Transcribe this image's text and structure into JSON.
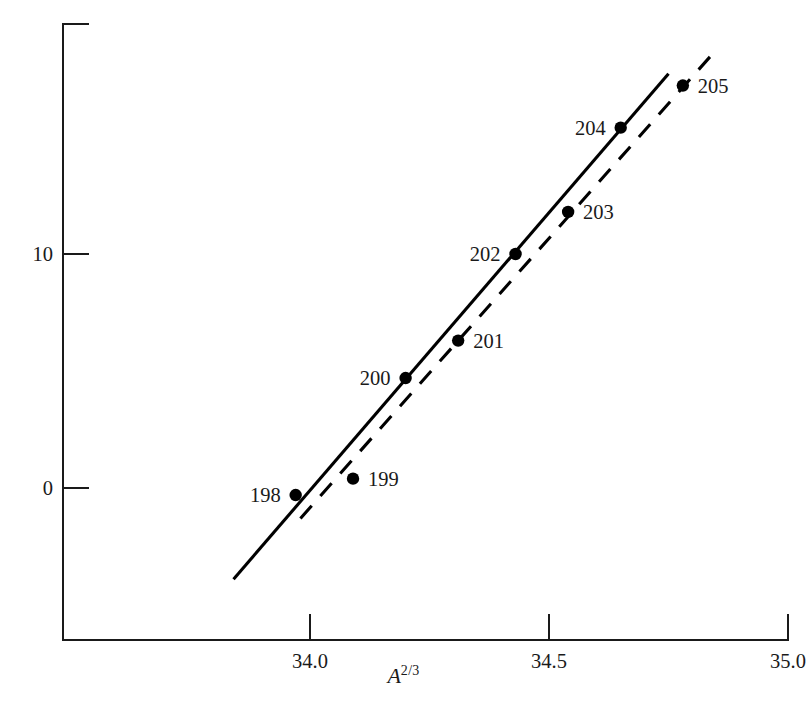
{
  "chart_data": {
    "type": "scatter",
    "title": "",
    "xlabel": "A^2/3",
    "xlabel_base": "A",
    "xlabel_exponent": "2/3",
    "ylabel": "Optical isotope shift (GHz)",
    "xlim": [
      33.6,
      35.0
    ],
    "ylim": [
      -6.3,
      19.9
    ],
    "xticks": [
      34.0,
      34.5,
      35.0
    ],
    "xticklabels": [
      "34.0",
      "34.5",
      "35.0"
    ],
    "yticks": [
      0,
      10
    ],
    "yticklabels": [
      "0",
      "10"
    ],
    "grid": false,
    "legend": "none",
    "points": [
      {
        "label": "198",
        "x": 33.97,
        "y": -0.3,
        "label_side": "left"
      },
      {
        "label": "199",
        "x": 34.09,
        "y": 0.4,
        "label_side": "right"
      },
      {
        "label": "200",
        "x": 34.2,
        "y": 4.7,
        "label_side": "left"
      },
      {
        "label": "201",
        "x": 34.31,
        "y": 6.3,
        "label_side": "right"
      },
      {
        "label": "202",
        "x": 34.43,
        "y": 10.0,
        "label_side": "left"
      },
      {
        "label": "203",
        "x": 34.54,
        "y": 11.8,
        "label_side": "right"
      },
      {
        "label": "204",
        "x": 34.65,
        "y": 15.4,
        "label_side": "left"
      },
      {
        "label": "205",
        "x": 34.78,
        "y": 17.2,
        "label_side": "right"
      }
    ],
    "lines": [
      {
        "name": "even-isotope-fit",
        "style": "solid",
        "x": [
          33.84,
          34.75
        ],
        "y": [
          -3.9,
          17.7
        ]
      },
      {
        "name": "odd-isotope-fit",
        "style": "dashed",
        "x": [
          33.98,
          34.84
        ],
        "y": [
          -1.3,
          18.5
        ]
      }
    ],
    "colors": {
      "axis": "#1a1a1a",
      "marker": "#000000",
      "solid_line": "#000000",
      "dashed_line": "#000000",
      "background": "#ffffff"
    }
  }
}
